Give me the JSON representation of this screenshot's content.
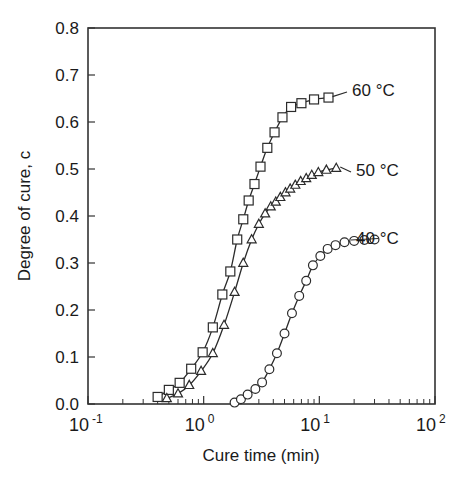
{
  "chart_data": {
    "type": "line",
    "title": "",
    "xlabel": "Cure time (min)",
    "ylabel": "Degree of cure, c",
    "xscale": "log",
    "yscale": "linear",
    "xlim": [
      0.1,
      100
    ],
    "ylim": [
      0.0,
      0.8
    ],
    "grid": false,
    "legend_position": "inline-right-of-curve-end",
    "x_tick_labels": [
      "10-1",
      "100",
      "101",
      "102"
    ],
    "x_tick_mantissa": [
      "10",
      "10",
      "10",
      "10"
    ],
    "x_tick_exponent": [
      "-1",
      "0",
      "1",
      "2"
    ],
    "x_tick_values": [
      0.1,
      1,
      10,
      100
    ],
    "y_tick_labels": [
      "0.0",
      "0.1",
      "0.2",
      "0.3",
      "0.4",
      "0.5",
      "0.6",
      "0.7",
      "0.8"
    ],
    "y_tick_values": [
      0.0,
      0.1,
      0.2,
      0.3,
      0.4,
      0.5,
      0.6,
      0.7,
      0.8
    ],
    "series": [
      {
        "name": "60 °C",
        "label": "60 °C",
        "marker": "square",
        "color": "#2b2b2b",
        "x": [
          0.4,
          0.5,
          0.62,
          0.78,
          0.98,
          1.2,
          1.45,
          1.7,
          1.95,
          2.2,
          2.45,
          2.75,
          3.1,
          3.55,
          4.1,
          4.8,
          5.7,
          7.0,
          9.0,
          12.0
        ],
        "y": [
          0.015,
          0.03,
          0.045,
          0.075,
          0.11,
          0.163,
          0.233,
          0.282,
          0.35,
          0.393,
          0.433,
          0.468,
          0.505,
          0.545,
          0.578,
          0.61,
          0.632,
          0.64,
          0.648,
          0.652
        ]
      },
      {
        "name": "50 °C",
        "label": "50 °C",
        "marker": "triangle",
        "color": "#2b2b2b",
        "x": [
          0.48,
          0.6,
          0.75,
          0.95,
          1.2,
          1.5,
          1.85,
          2.2,
          2.6,
          3.0,
          3.4,
          3.8,
          4.2,
          4.6,
          5.1,
          5.6,
          6.2,
          6.9,
          7.7,
          8.6,
          9.8,
          11.5,
          14.0
        ],
        "y": [
          0.012,
          0.022,
          0.04,
          0.07,
          0.108,
          0.168,
          0.238,
          0.3,
          0.35,
          0.383,
          0.405,
          0.42,
          0.43,
          0.44,
          0.45,
          0.458,
          0.466,
          0.474,
          0.48,
          0.487,
          0.493,
          0.498,
          0.502
        ]
      },
      {
        "name": "40 °C",
        "label": "40 °C",
        "marker": "circle",
        "color": "#2b2b2b",
        "x": [
          1.85,
          2.1,
          2.4,
          2.8,
          3.2,
          3.7,
          4.3,
          5.0,
          5.8,
          6.7,
          7.7,
          8.8,
          10.2,
          11.8,
          13.8,
          16.5,
          20.0,
          24.5,
          30.0
        ],
        "y": [
          0.003,
          0.01,
          0.02,
          0.032,
          0.046,
          0.074,
          0.108,
          0.15,
          0.193,
          0.23,
          0.262,
          0.295,
          0.315,
          0.33,
          0.338,
          0.344,
          0.347,
          0.349,
          0.35
        ]
      }
    ]
  },
  "geometry": {
    "plot_left": 88,
    "plot_right": 435,
    "plot_top": 28,
    "plot_bottom": 404
  }
}
